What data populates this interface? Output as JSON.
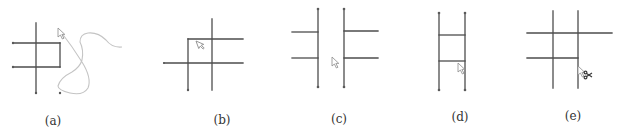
{
  "figure": {
    "panels": [
      {
        "id": "a",
        "label": "(a)",
        "cursor": "arrow-cursor-icon",
        "note": "freehand stroke drawn across grid"
      },
      {
        "id": "b",
        "label": "(b)",
        "cursor": "arrow-cursor-icon"
      },
      {
        "id": "c",
        "label": "(c)",
        "cursor": "arrow-cursor-icon"
      },
      {
        "id": "d",
        "label": "(d)",
        "cursor": "arrow-cursor-icon"
      },
      {
        "id": "e",
        "label": "(e)",
        "cursor": "scissors-cursor-icon"
      }
    ],
    "colors": {
      "line": "#4d4d4d",
      "stroke": "#c4c4c4",
      "background": "#ffffff"
    }
  }
}
